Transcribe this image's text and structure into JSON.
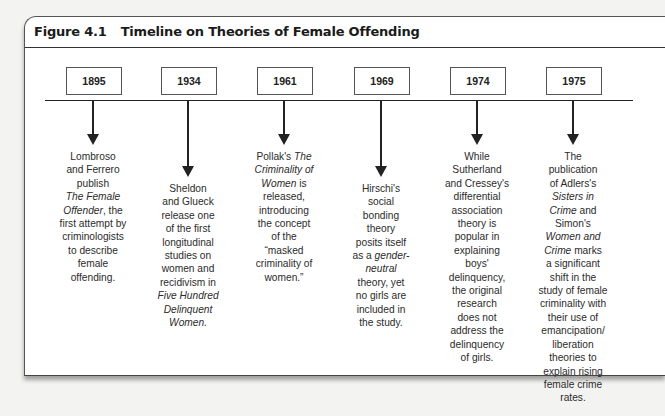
{
  "figure": {
    "number": "Figure 4.1",
    "title": "Timeline on Theories of Female Offending"
  },
  "events": [
    {
      "year": "1895",
      "center_x": 93,
      "arrow": "short",
      "lines": [
        [
          {
            "t": "Lombroso"
          }
        ],
        [
          {
            "t": "and Ferrero"
          }
        ],
        [
          {
            "t": "publish"
          }
        ],
        [
          {
            "t": "The Female",
            "i": true
          }
        ],
        [
          {
            "t": "Offender",
            "i": true
          },
          {
            "t": ", the"
          }
        ],
        [
          {
            "t": "first attempt by"
          }
        ],
        [
          {
            "t": "criminologists"
          }
        ],
        [
          {
            "t": "to describe"
          }
        ],
        [
          {
            "t": "female"
          }
        ],
        [
          {
            "t": "offending."
          }
        ]
      ]
    },
    {
      "year": "1934",
      "center_x": 188,
      "arrow": "long",
      "lines": [
        [
          {
            "t": "Sheldon"
          }
        ],
        [
          {
            "t": "and Glueck"
          }
        ],
        [
          {
            "t": "release one"
          }
        ],
        [
          {
            "t": "of the first"
          }
        ],
        [
          {
            "t": "longitudinal"
          }
        ],
        [
          {
            "t": "studies on"
          }
        ],
        [
          {
            "t": "women and"
          }
        ],
        [
          {
            "t": "recidivism in"
          }
        ],
        [
          {
            "t": "Five Hundred",
            "i": true
          }
        ],
        [
          {
            "t": "Delinquent",
            "i": true
          }
        ],
        [
          {
            "t": "Women.",
            "i": true
          }
        ]
      ]
    },
    {
      "year": "1961",
      "center_x": 284,
      "arrow": "short",
      "lines": [
        [
          {
            "t": "Pollak's "
          },
          {
            "t": "The",
            "i": true
          }
        ],
        [
          {
            "t": "Criminality of",
            "i": true
          }
        ],
        [
          {
            "t": "Women",
            "i": true
          },
          {
            "t": " is"
          }
        ],
        [
          {
            "t": "released,"
          }
        ],
        [
          {
            "t": "introducing"
          }
        ],
        [
          {
            "t": "the concept"
          }
        ],
        [
          {
            "t": "of the"
          }
        ],
        [
          {
            "t": "“masked"
          }
        ],
        [
          {
            "t": "criminality of"
          }
        ],
        [
          {
            "t": "women.”"
          }
        ]
      ]
    },
    {
      "year": "1969",
      "center_x": 381,
      "arrow": "long",
      "lines": [
        [
          {
            "t": "Hirschi's"
          }
        ],
        [
          {
            "t": "social"
          }
        ],
        [
          {
            "t": "bonding"
          }
        ],
        [
          {
            "t": "theory"
          }
        ],
        [
          {
            "t": "posits itself"
          }
        ],
        [
          {
            "t": "as a "
          },
          {
            "t": "gender-",
            "i": true
          }
        ],
        [
          {
            "t": "neutral",
            "i": true
          }
        ],
        [
          {
            "t": "theory, yet"
          }
        ],
        [
          {
            "t": "no girls are"
          }
        ],
        [
          {
            "t": "included in"
          }
        ],
        [
          {
            "t": "the study."
          }
        ]
      ]
    },
    {
      "year": "1974",
      "center_x": 477,
      "arrow": "short",
      "lines": [
        [
          {
            "t": "While"
          }
        ],
        [
          {
            "t": "Sutherland"
          }
        ],
        [
          {
            "t": "and Cressey's"
          }
        ],
        [
          {
            "t": "differential"
          }
        ],
        [
          {
            "t": "association"
          }
        ],
        [
          {
            "t": "theory is"
          }
        ],
        [
          {
            "t": "popular in"
          }
        ],
        [
          {
            "t": "explaining"
          }
        ],
        [
          {
            "t": "boys'"
          }
        ],
        [
          {
            "t": "delinquency,"
          }
        ],
        [
          {
            "t": "the original"
          }
        ],
        [
          {
            "t": "research"
          }
        ],
        [
          {
            "t": "does not"
          }
        ],
        [
          {
            "t": "address the"
          }
        ],
        [
          {
            "t": "delinquency"
          }
        ],
        [
          {
            "t": "of girls."
          }
        ]
      ]
    },
    {
      "year": "1975",
      "center_x": 573,
      "arrow": "short",
      "lines": [
        [
          {
            "t": "The"
          }
        ],
        [
          {
            "t": "publication"
          }
        ],
        [
          {
            "t": "of Adlers's"
          }
        ],
        [
          {
            "t": "Sisters in",
            "i": true
          }
        ],
        [
          {
            "t": "Crime",
            "i": true
          },
          {
            "t": " and"
          }
        ],
        [
          {
            "t": "Simon's"
          }
        ],
        [
          {
            "t": "Women and",
            "i": true
          }
        ],
        [
          {
            "t": "Crime",
            "i": true
          },
          {
            "t": " marks"
          }
        ],
        [
          {
            "t": "a significant"
          }
        ],
        [
          {
            "t": "shift in the"
          }
        ],
        [
          {
            "t": "study of female"
          }
        ],
        [
          {
            "t": "criminality with"
          }
        ],
        [
          {
            "t": "their use of"
          }
        ],
        [
          {
            "t": "emancipation/"
          }
        ],
        [
          {
            "t": "liberation"
          }
        ],
        [
          {
            "t": "theories to"
          }
        ],
        [
          {
            "t": "explain rising"
          }
        ],
        [
          {
            "t": "female crime"
          }
        ],
        [
          {
            "t": "rates."
          }
        ]
      ]
    }
  ]
}
